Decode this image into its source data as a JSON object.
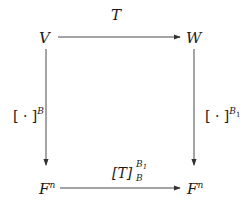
{
  "diagram": {
    "type": "commutative-diagram",
    "nodes": {
      "top_left": {
        "label": "V"
      },
      "top_right": {
        "label": "W"
      },
      "bottom_left": {
        "base": "F",
        "exp": "n"
      },
      "bottom_right": {
        "base": "F",
        "exp": "n"
      }
    },
    "arrows": {
      "top": {
        "label": "T",
        "from": "V",
        "to": "W"
      },
      "left": {
        "label_main": "[ · ]",
        "label_sup": "B",
        "from": "V",
        "to": "F^n"
      },
      "right": {
        "label_main": "[ · ]",
        "label_sup": "B",
        "label_sup_sub": "1",
        "from": "W",
        "to": "F^n"
      },
      "bottom": {
        "label_main": "[T]",
        "label_sup": "B",
        "label_sup_sub": "1",
        "label_sub": "B",
        "from": "F^n",
        "to": "F^n"
      }
    },
    "colors": {
      "stroke": "#333333",
      "text": "#1a1a1a",
      "background": "#ffffff"
    }
  }
}
